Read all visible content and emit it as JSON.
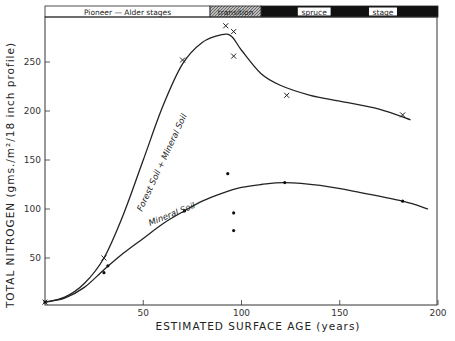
{
  "chart_data": {
    "type": "scatter",
    "title": "",
    "xlabel": "ESTIMATED SURFACE AGE (years)",
    "ylabel": "TOTAL NITROGEN (gms./m²/18 inch profile)",
    "xlim": [
      0,
      200
    ],
    "ylim": [
      0,
      290
    ],
    "xticks": [
      50,
      100,
      150,
      200
    ],
    "yticks": [
      50,
      100,
      150,
      200,
      250
    ],
    "grid": false,
    "stage_bands": [
      {
        "label": "Pioneer  —  Alder   stages",
        "from": 0,
        "to": 84,
        "style": "white"
      },
      {
        "label": "transition",
        "from": 84,
        "to": 110,
        "style": "hatched"
      },
      {
        "label": "spruce",
        "from": 110,
        "to": 200,
        "style": "black",
        "label_at": 137
      },
      {
        "label": "stage",
        "from": 110,
        "to": 200,
        "style": "black",
        "label_at": 172
      }
    ],
    "series": [
      {
        "name": "Forest Soil + Mineral Soil",
        "marker": "x",
        "points": [
          [
            0,
            5
          ],
          [
            30,
            50
          ],
          [
            70,
            252
          ],
          [
            92,
            287
          ],
          [
            96,
            281
          ],
          [
            96,
            256
          ],
          [
            123,
            216
          ],
          [
            182,
            196
          ]
        ],
        "curve": [
          [
            0,
            5
          ],
          [
            10,
            10
          ],
          [
            20,
            24
          ],
          [
            30,
            50
          ],
          [
            40,
            95
          ],
          [
            50,
            150
          ],
          [
            60,
            205
          ],
          [
            70,
            248
          ],
          [
            80,
            270
          ],
          [
            90,
            278
          ],
          [
            95,
            276
          ],
          [
            100,
            262
          ],
          [
            110,
            238
          ],
          [
            120,
            226
          ],
          [
            135,
            216
          ],
          [
            150,
            210
          ],
          [
            170,
            202
          ],
          [
            186,
            191
          ]
        ]
      },
      {
        "name": "Mineral Soil",
        "marker": "dot",
        "points": [
          [
            0,
            5
          ],
          [
            30,
            35
          ],
          [
            32,
            42
          ],
          [
            71,
            98
          ],
          [
            93,
            136
          ],
          [
            96,
            96
          ],
          [
            96,
            78
          ],
          [
            122,
            127
          ],
          [
            182,
            108
          ]
        ],
        "curve": [
          [
            0,
            5
          ],
          [
            10,
            9
          ],
          [
            20,
            20
          ],
          [
            30,
            38
          ],
          [
            40,
            55
          ],
          [
            50,
            70
          ],
          [
            60,
            85
          ],
          [
            70,
            97
          ],
          [
            80,
            108
          ],
          [
            90,
            116
          ],
          [
            100,
            122
          ],
          [
            110,
            125
          ],
          [
            122,
            127
          ],
          [
            140,
            124
          ],
          [
            160,
            117
          ],
          [
            182,
            108
          ],
          [
            195,
            100
          ]
        ]
      }
    ]
  }
}
